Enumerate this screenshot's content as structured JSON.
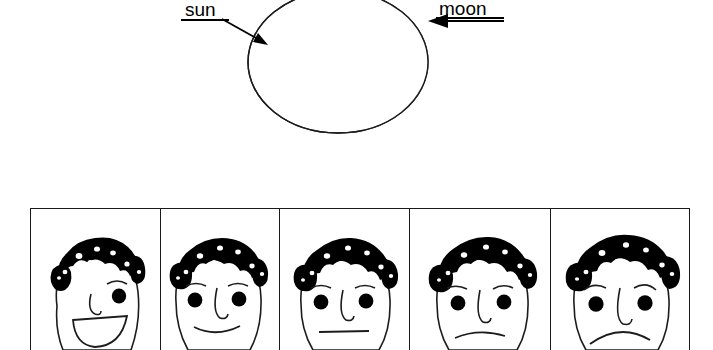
{
  "figure": {
    "background_color": "#ffffff",
    "ink_color": "#000000",
    "width": 713,
    "height": 350
  },
  "eclipse": {
    "title": "solar eclipse diagram",
    "sun": {
      "label": "sun",
      "underlined": true,
      "arrow": "diagonal-arrow-down-right",
      "points_to": "black crescent on left side of disc",
      "label_position": {
        "x": 185,
        "y": 0
      }
    },
    "moon": {
      "label": "moon",
      "underlined": true,
      "arrow": "horizontal-arrow-left",
      "points_to": "right edge of white disc",
      "label_position": {
        "x": 439,
        "y": 0
      }
    },
    "disc": {
      "name": "sun-disc-outline",
      "center_x": 338,
      "center_y": 62,
      "radius_x": 90,
      "radius_y": 71,
      "fill": "#ffffff",
      "stroke": "#000000"
    },
    "crescent": {
      "name": "moon-shadow-crescent",
      "fill": "#000000",
      "side": "left"
    }
  },
  "face_strip": {
    "name": "expression-sequence",
    "panel_count": 5,
    "frame_color": "#1a1a1a",
    "hair_color": "#000000",
    "skin_color": "#ffffff",
    "panels": [
      {
        "index": 1,
        "expression": "big open smile",
        "mood": "happy",
        "view": "three-quarter profile facing right",
        "mouth": "wide open grin",
        "eyes": 2,
        "hair": "curly black afro"
      },
      {
        "index": 2,
        "expression": "slight smile",
        "mood": "content",
        "view": "front facing",
        "mouth": "small upturned curve",
        "eyes": 2,
        "hair": "curly black afro"
      },
      {
        "index": 3,
        "expression": "neutral",
        "mood": "neutral",
        "view": "front facing",
        "mouth": "straight line",
        "eyes": 2,
        "hair": "curly black afro"
      },
      {
        "index": 4,
        "expression": "slight frown",
        "mood": "unhappy",
        "view": "front facing",
        "mouth": "small downturned curve",
        "eyes": 2,
        "hair": "curly black afro"
      },
      {
        "index": 5,
        "expression": "deep frown",
        "mood": "sad",
        "view": "front facing",
        "mouth": "wide downturned curve",
        "eyes": 2,
        "hair": "curly black afro"
      }
    ],
    "panel_widths": [
      130,
      120,
      130,
      142,
      138
    ]
  }
}
